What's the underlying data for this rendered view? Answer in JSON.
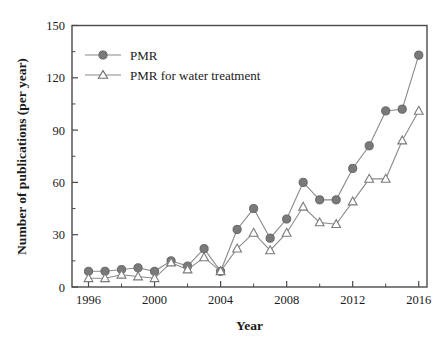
{
  "chart_data": {
    "type": "line",
    "title": "",
    "xlabel": "Year",
    "ylabel": "Number of publications (per year)",
    "x": [
      1996,
      1997,
      1998,
      1999,
      2000,
      2001,
      2002,
      2003,
      2004,
      2005,
      2006,
      2007,
      2008,
      2009,
      2010,
      2011,
      2012,
      2013,
      2014,
      2015,
      2016
    ],
    "xlim": [
      1995,
      2016.5
    ],
    "ylim": [
      0,
      150
    ],
    "xticks": [
      1996,
      2000,
      2004,
      2008,
      2012,
      2016
    ],
    "xtick_labels": [
      "1996",
      "2000",
      "2004",
      "2008",
      "2012",
      "2016"
    ],
    "yticks": [
      0,
      30,
      60,
      90,
      120,
      150
    ],
    "ytick_labels": [
      "0",
      "30",
      "60",
      "90",
      "120",
      "150"
    ],
    "xminor_ticks": [
      1998,
      2002,
      2006,
      2010,
      2014
    ],
    "yminor_ticks": [
      15,
      45,
      75,
      105,
      135
    ],
    "grid": false,
    "legend_position": "upper-left",
    "series": [
      {
        "name": "PMR",
        "marker": "filled-circle",
        "color": "#7a7a7a",
        "line_color": "#8a8a8a",
        "values": [
          9,
          9,
          10,
          11,
          9,
          15,
          12,
          22,
          9,
          33,
          45,
          28,
          39,
          60,
          50,
          50,
          68,
          81,
          101,
          102,
          133
        ]
      },
      {
        "name": "PMR for water treatment",
        "marker": "open-triangle",
        "color": "#ffffff",
        "line_color": "#8a8a8a",
        "edge_color": "#7a7a7a",
        "values": [
          5,
          5,
          7,
          6,
          5,
          14,
          10,
          17,
          9,
          22,
          31,
          21,
          31,
          46,
          37,
          36,
          49,
          62,
          62,
          84,
          101
        ]
      }
    ]
  },
  "legend": {
    "items": [
      {
        "label": "PMR"
      },
      {
        "label": "PMR for water treatment"
      }
    ]
  },
  "colors": {
    "axis": "#4a4a4a",
    "text": "#1a1a1a",
    "series_gray": "#7a7a7a",
    "line_gray": "#8a8a8a",
    "background": "#ffffff"
  }
}
